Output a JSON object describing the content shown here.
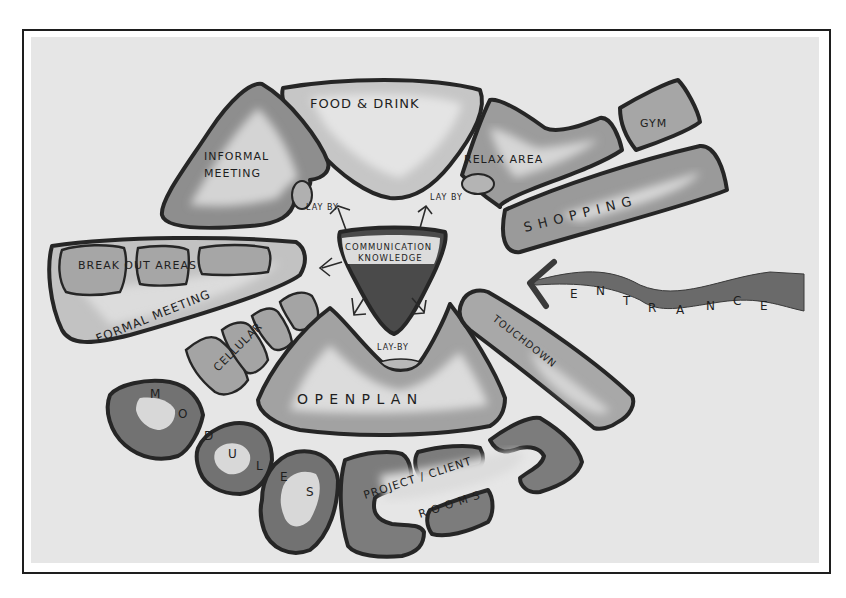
{
  "diagram": {
    "type": "bubble-diagram",
    "colors": {
      "frame": "#1e1e1e",
      "background": "#e6e6e6",
      "outline": "#262626",
      "dark_fill": "#6e6e6e",
      "mid_fill": "#9a9a9a",
      "light_fill": "#c4c4c4",
      "highlight": "#e4e4e4",
      "core_dark": "#4a4a4a"
    },
    "zones": [
      {
        "id": "food-drink",
        "label": "FOOD & DRINK"
      },
      {
        "id": "informal-meeting",
        "label_line1": "INFORMAL",
        "label_line2": "MEETING"
      },
      {
        "id": "relax-area",
        "label": "RELAX AREA"
      },
      {
        "id": "gym",
        "label": "GYM"
      },
      {
        "id": "shopping",
        "label": "S H O P P I N G"
      },
      {
        "id": "break-out-areas",
        "label": "BREAK OUT AREAS"
      },
      {
        "id": "formal-meeting",
        "label": "FORMAL MEETING"
      },
      {
        "id": "cellular",
        "label": "CELLULAR"
      },
      {
        "id": "communication-knowledge",
        "label_line1": "COMMUNICATION",
        "label_line2": "KNOWLEDGE"
      },
      {
        "id": "open-plan",
        "label": "O P E N   P L A N"
      },
      {
        "id": "touchdown",
        "label": "TOUCHDOWN"
      },
      {
        "id": "modules",
        "letters": [
          "M",
          "O",
          "D",
          "U",
          "L",
          "E",
          "S"
        ]
      },
      {
        "id": "project-client-rooms",
        "label_line1": "PROJECT / CLIENT",
        "label_line2": "R O O M S"
      }
    ],
    "lay_by_labels": [
      "LAY BY",
      "LAY BY",
      "LAY-BY"
    ],
    "entrance": {
      "letters": [
        "E",
        "N",
        "T",
        "R",
        "A",
        "N",
        "C",
        "E"
      ]
    }
  }
}
